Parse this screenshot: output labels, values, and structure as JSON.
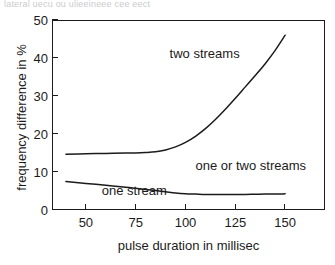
{
  "scan": {
    "top_text_remnant": "lateral uecu ou ulieeineee cee eect"
  },
  "chart_data": {
    "type": "line",
    "title": "",
    "subtitle": "",
    "xlabel": "pulse duration in millisec",
    "ylabel": "frequency difference in %",
    "xlim": [
      33,
      170
    ],
    "ylim": [
      0,
      50
    ],
    "xticks": [
      50,
      75,
      100,
      125,
      150
    ],
    "yticks": [
      0,
      10,
      20,
      30,
      40,
      50
    ],
    "xtick_labels": [
      "50",
      "75",
      "100",
      "125",
      "150"
    ],
    "ytick_labels": [
      "0",
      "10",
      "20",
      "30",
      "40",
      "50"
    ],
    "grid": false,
    "legend": false,
    "legend_position": "none",
    "line_color": "#1b1b1b",
    "background_color": "#ffffff",
    "series": [
      {
        "name": "upper boundary (two streams threshold)",
        "x": [
          40,
          50,
          60,
          70,
          75,
          80,
          85,
          90,
          95,
          100,
          105,
          110,
          115,
          120,
          125,
          130,
          135,
          140,
          145,
          150
        ],
        "values": [
          14.7,
          14.8,
          14.9,
          15.0,
          15.0,
          15.1,
          15.3,
          15.8,
          16.6,
          17.8,
          19.4,
          21.4,
          23.8,
          26.5,
          29.4,
          32.4,
          35.4,
          38.5,
          42.0,
          46.0
        ]
      },
      {
        "name": "lower boundary (one stream threshold)",
        "x": [
          40,
          50,
          60,
          70,
          75,
          80,
          85,
          90,
          95,
          100,
          105,
          110,
          115,
          120,
          125,
          130,
          135,
          140,
          145,
          150
        ],
        "values": [
          7.5,
          7.0,
          6.5,
          6.0,
          5.7,
          5.4,
          5.1,
          4.8,
          4.5,
          4.3,
          4.2,
          4.1,
          4.1,
          4.1,
          4.1,
          4.1,
          4.15,
          4.2,
          4.2,
          4.25
        ]
      }
    ],
    "annotations": [
      {
        "text": "two streams",
        "x": 92,
        "y": 41
      },
      {
        "text": "one or two streams",
        "x": 105,
        "y": 11.6
      },
      {
        "text": "one stream",
        "x": 58,
        "y": 4.9
      }
    ]
  }
}
